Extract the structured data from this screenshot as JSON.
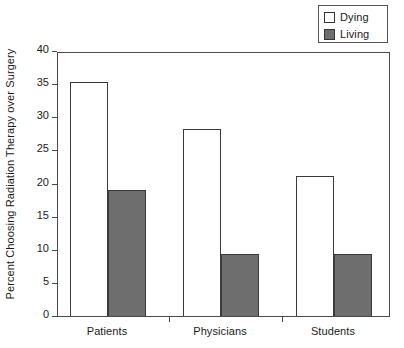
{
  "chart_data": {
    "type": "bar",
    "title": "",
    "xlabel": "",
    "ylabel": "Percent Choosing Radiation Therapy over Surgery",
    "ylim": [
      0,
      40
    ],
    "yticks": [
      0,
      5,
      10,
      15,
      20,
      25,
      30,
      35,
      40
    ],
    "ytick_labels": [
      "0",
      "5",
      "10",
      "15",
      "20",
      "25",
      "30",
      "35",
      "40"
    ],
    "grid": false,
    "legend_position": "top-right",
    "categories": [
      "Patients",
      "Physicians",
      "Students"
    ],
    "series": [
      {
        "name": "Dying",
        "color": "#ffffff",
        "edge_color": "#3a3a3a",
        "values": [
          35.3,
          28.3,
          21.2
        ]
      },
      {
        "name": "Living",
        "color": "#6e6e6e",
        "edge_color": "#3a3a3a",
        "values": [
          19.0,
          9.3,
          9.3
        ]
      }
    ]
  },
  "legend": {
    "items": [
      {
        "label": "Dying",
        "swatch": "white-square-icon"
      },
      {
        "label": "Living",
        "swatch": "gray-square-icon"
      }
    ]
  },
  "axes": {
    "y_title": "Percent Choosing Radiation Therapy over Surgery",
    "y_tick_labels": [
      "40",
      "35",
      "30",
      "25",
      "20",
      "15",
      "10",
      "5",
      "0"
    ],
    "x_tick_labels": [
      "Patients",
      "Physicians",
      "Students"
    ]
  },
  "colors": {
    "living_fill": "#6e6e6e",
    "dying_fill": "#ffffff",
    "axis": "#4a4a4a",
    "text": "#1a1a1a",
    "background": "#ffffff"
  }
}
